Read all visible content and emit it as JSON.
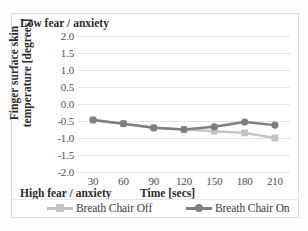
{
  "figure": {
    "annotation_top_left": "Low fear / anxiety",
    "annotation_bottom_left": "High fear / anxiety",
    "frame_color": "#dcdcdc",
    "background": "#ffffff"
  },
  "chart_data": {
    "type": "line",
    "title": "",
    "xlabel": "Time [secs]",
    "ylabel_line1": "Finger surface skin",
    "ylabel_line2": "temperature [degrees]",
    "categories": [
      "30",
      "60",
      "90",
      "120",
      "150",
      "180",
      "210"
    ],
    "x": [
      30,
      60,
      90,
      120,
      150,
      180,
      210
    ],
    "xlim": [
      15,
      225
    ],
    "ylim": [
      -2.0,
      2.0
    ],
    "yticks": [
      "2.0",
      "1.5",
      "1.0",
      "0.5",
      "0.0",
      "-0.5",
      "-1.0",
      "-1.5",
      "-2.0"
    ],
    "ytick_values": [
      2.0,
      1.5,
      1.0,
      0.5,
      0.0,
      -0.5,
      -1.0,
      -1.5,
      -2.0
    ],
    "grid": true,
    "legend_position": "bottom",
    "series": [
      {
        "name": "Breath Chair Off",
        "color": "#c3c3c3",
        "marker": "square",
        "values": [
          -0.47,
          -0.58,
          -0.7,
          -0.75,
          -0.8,
          -0.85,
          -1.0
        ]
      },
      {
        "name": "Breath Chair On",
        "color": "#7f7f7f",
        "marker": "circle",
        "values": [
          -0.47,
          -0.58,
          -0.7,
          -0.75,
          -0.67,
          -0.53,
          -0.62
        ]
      }
    ]
  },
  "legend": {
    "items": [
      {
        "label": "Breath Chair Off",
        "color": "#c3c3c3"
      },
      {
        "label": "Breath Chair On",
        "color": "#7f7f7f"
      }
    ]
  }
}
